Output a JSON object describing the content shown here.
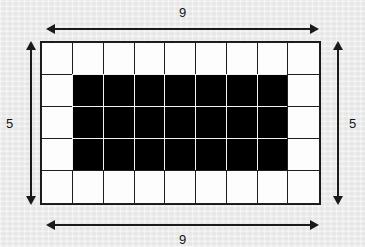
{
  "diagram": {
    "type": "grid-rectangle-with-border",
    "grid": {
      "columns": 9,
      "rows": 5,
      "cell_fill_default": "white",
      "filled_color": "#000000",
      "unfilled_color": "#fdfdfd",
      "border_color": "#1a1a1a",
      "filled_region": {
        "col_start": 2,
        "col_end": 8,
        "row_start": 2,
        "row_end": 4,
        "width_cells": 7,
        "height_cells": 3
      },
      "cells": [
        [
          "white",
          "white",
          "white",
          "white",
          "white",
          "white",
          "white",
          "white",
          "white"
        ],
        [
          "white",
          "black",
          "black",
          "black",
          "black",
          "black",
          "black",
          "black",
          "white"
        ],
        [
          "white",
          "black",
          "black",
          "black",
          "black",
          "black",
          "black",
          "black",
          "white"
        ],
        [
          "white",
          "black",
          "black",
          "black",
          "black",
          "black",
          "black",
          "black",
          "white"
        ],
        [
          "white",
          "white",
          "white",
          "white",
          "white",
          "white",
          "white",
          "white",
          "white"
        ]
      ]
    },
    "dimensions": {
      "top": {
        "label": "9",
        "orientation": "horizontal"
      },
      "bottom": {
        "label": "9",
        "orientation": "horizontal"
      },
      "left": {
        "label": "5",
        "orientation": "vertical"
      },
      "right": {
        "label": "5",
        "orientation": "vertical"
      }
    },
    "background_color": "#ebebeb"
  }
}
